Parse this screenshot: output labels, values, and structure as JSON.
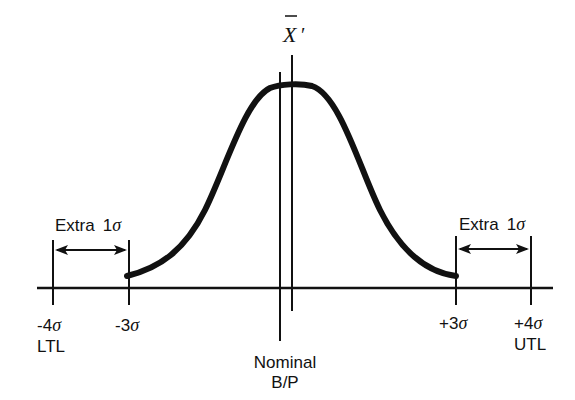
{
  "diagram": {
    "title_symbol": "X̄′",
    "labels": {
      "left_extra": {
        "word": "Extra",
        "num": "1",
        "sym": "σ"
      },
      "right_extra": {
        "word": "Extra",
        "num": "1",
        "sym": "σ"
      },
      "ticks": [
        {
          "id": "minus4",
          "value": "-4",
          "sym": "σ",
          "sub": "LTL"
        },
        {
          "id": "minus3",
          "value": "-3",
          "sym": "σ",
          "sub": ""
        },
        {
          "id": "plus3",
          "value": "+3",
          "sym": "σ",
          "sub": ""
        },
        {
          "id": "plus4",
          "value": "+4",
          "sym": "σ",
          "sub": "UTL"
        }
      ],
      "nominal_line1": "Nominal",
      "nominal_line2": "B/P"
    },
    "colors": {
      "ink": "#111111",
      "background": "#ffffff"
    }
  }
}
